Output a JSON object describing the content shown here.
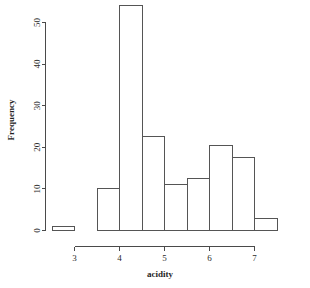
{
  "chart_data": {
    "type": "bar",
    "title": "",
    "subtitle": "",
    "xlabel": "acidity",
    "ylabel": "Frequency",
    "grid": false,
    "legend": false,
    "legend_position": "none",
    "bin_width": 0.5,
    "bin_edges": [
      2.5,
      3.0,
      3.5,
      4.0,
      4.5,
      5.0,
      5.5,
      6.0,
      6.5,
      7.0,
      7.5
    ],
    "categories": [
      "2.5-3.0",
      "3.0-3.5",
      "3.5-4.0",
      "4.0-4.5",
      "4.5-5.0",
      "5.0-5.5",
      "5.5-6.0",
      "6.0-6.5",
      "6.5-7.0",
      "7.0-7.5"
    ],
    "values": [
      1,
      0,
      10,
      54,
      22.5,
      11,
      12.5,
      20.5,
      17.5,
      3
    ],
    "xlim": [
      2.5,
      7.5
    ],
    "ylim": [
      0,
      54
    ],
    "xticks": [
      3,
      4,
      5,
      6,
      7
    ],
    "xtick_labels": [
      "3",
      "4",
      "5",
      "6",
      "7"
    ],
    "yticks": [
      0,
      10,
      20,
      30,
      40,
      50
    ],
    "ytick_labels": [
      "0",
      "10",
      "20",
      "30",
      "40",
      "50"
    ],
    "bar_fill_color": "#ffffff",
    "bar_edge_color": "#555555",
    "axis_color": "#4a4a4a"
  }
}
